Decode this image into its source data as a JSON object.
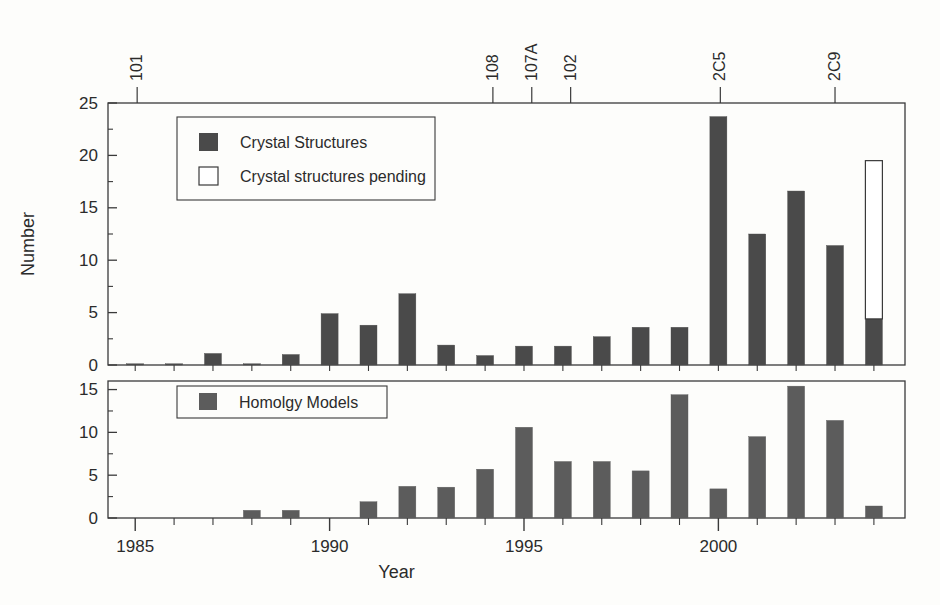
{
  "figure": {
    "background": "#fdfdfb",
    "axis_color": "#3a3a3a",
    "crystal_color": "#4a4a4a",
    "pending_color": "#ffffff",
    "homology_color": "#5c5c5c"
  },
  "axes": {
    "xlabel": "Year",
    "ylabel": "Number",
    "x_ticks": [
      1985,
      1990,
      1995,
      2000
    ],
    "x_tick_labels": [
      "1985",
      "1990",
      "1995",
      "2000"
    ],
    "x_minor_step": 1,
    "xlim": [
      1984.3,
      2004.8
    ],
    "upper_y_ticks": [
      0,
      5,
      10,
      15,
      20,
      25
    ],
    "upper_y_tick_labels": [
      "0",
      "5",
      "10",
      "15",
      "20",
      "25"
    ],
    "upper_ylim": [
      0,
      25
    ],
    "lower_y_ticks": [
      0,
      5,
      10,
      15
    ],
    "lower_y_tick_labels": [
      "0",
      "5",
      "10",
      "15"
    ],
    "lower_ylim": [
      0,
      16
    ],
    "grid": false
  },
  "top_annotations": [
    {
      "label": "101",
      "year": 1985.05
    },
    {
      "label": "108",
      "year": 1994.2
    },
    {
      "label": "107A",
      "year": 1995.2
    },
    {
      "label": "102",
      "year": 1996.2
    },
    {
      "label": "2C5",
      "year": 2000.05
    },
    {
      "label": "2C9",
      "year": 2003.0
    }
  ],
  "legends": {
    "upper": [
      {
        "label": "Crystal Structures",
        "swatch": "filled"
      },
      {
        "label": "Crystal structures pending",
        "swatch": "open"
      }
    ],
    "lower": [
      {
        "label": "Homolgy Models",
        "swatch": "filled"
      }
    ]
  },
  "chart_data": [
    {
      "type": "bar",
      "panel": "upper",
      "title": "",
      "xlabel": "",
      "ylabel": "Number",
      "ylim": [
        0,
        25
      ],
      "xlim": [
        1984.3,
        2004.8
      ],
      "grid": false,
      "legend_position": "upper-left",
      "categories": [
        1985,
        1986,
        1987,
        1988,
        1989,
        1990,
        1991,
        1992,
        1993,
        1994,
        1995,
        1996,
        1997,
        1998,
        1999,
        2000,
        2001,
        2002,
        2003,
        2004
      ],
      "series": [
        {
          "name": "Crystal Structures",
          "color": "#4a4a4a",
          "values": [
            0.1,
            0.1,
            1.1,
            0.1,
            1.0,
            4.9,
            3.8,
            6.8,
            1.9,
            0.9,
            1.8,
            1.8,
            2.7,
            3.6,
            3.6,
            23.7,
            12.5,
            16.6,
            11.4,
            4.4
          ]
        },
        {
          "name": "Crystal structures pending",
          "color": "#ffffff",
          "stacked_on": "Crystal Structures",
          "values": [
            0,
            0,
            0,
            0,
            0,
            0,
            0,
            0,
            0,
            0,
            0,
            0,
            0,
            0,
            0,
            0,
            0,
            0,
            0,
            15.1
          ],
          "cumulative_top": [
            null,
            null,
            null,
            null,
            null,
            null,
            null,
            null,
            null,
            null,
            null,
            null,
            null,
            null,
            null,
            null,
            null,
            null,
            null,
            19.5
          ]
        }
      ]
    },
    {
      "type": "bar",
      "panel": "lower",
      "title": "",
      "xlabel": "Year",
      "ylabel": "",
      "ylim": [
        0,
        16
      ],
      "xlim": [
        1984.3,
        2004.8
      ],
      "grid": false,
      "legend_position": "upper-left",
      "categories": [
        1985,
        1986,
        1987,
        1988,
        1989,
        1990,
        1991,
        1992,
        1993,
        1994,
        1995,
        1996,
        1997,
        1998,
        1999,
        2000,
        2001,
        2002,
        2003,
        2004
      ],
      "series": [
        {
          "name": "Homolgy Models",
          "color": "#5c5c5c",
          "values": [
            0,
            0,
            0,
            0.9,
            0.9,
            0,
            1.9,
            3.7,
            3.6,
            5.7,
            10.6,
            6.6,
            6.6,
            5.5,
            14.4,
            3.4,
            9.5,
            15.4,
            11.4,
            1.4
          ]
        }
      ]
    }
  ]
}
